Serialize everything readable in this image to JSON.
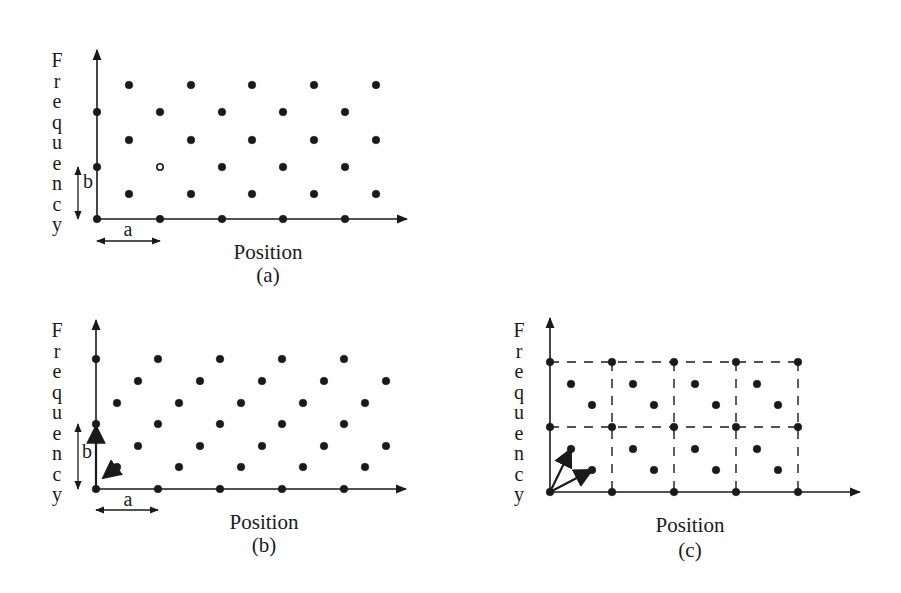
{
  "figure": {
    "ink_color": "#1a1a1a",
    "background": "#ffffff",
    "panels": [
      {
        "id": "a",
        "caption": "(a)",
        "x_label": "Position",
        "y_label": "Frequency",
        "origin": [
          97,
          219
        ],
        "x_axis_end": 407,
        "y_axis_top": 50,
        "y_label_x": 57,
        "y_label_top": 53,
        "y_label_step": 20.5,
        "x_label_pos": [
          268,
          259
        ],
        "caption_pos": [
          268,
          282
        ],
        "lattice": "rectangular-staggered",
        "points": [
          [
            97,
            219
          ],
          [
            160,
            219
          ],
          [
            222,
            219
          ],
          [
            283,
            219
          ],
          [
            345,
            219
          ],
          [
            129,
            194
          ],
          [
            191,
            194
          ],
          [
            252,
            194
          ],
          [
            314,
            194
          ],
          [
            376,
            194
          ],
          [
            97,
            167
          ],
          [
            160,
            167
          ],
          [
            222,
            167
          ],
          [
            283,
            167
          ],
          [
            345,
            167
          ],
          [
            129,
            140
          ],
          [
            191,
            140
          ],
          [
            252,
            140
          ],
          [
            314,
            140
          ],
          [
            376,
            140
          ],
          [
            97,
            112
          ],
          [
            160,
            112
          ],
          [
            222,
            112
          ],
          [
            283,
            112
          ],
          [
            345,
            112
          ],
          [
            129,
            85
          ],
          [
            191,
            85
          ],
          [
            252,
            85
          ],
          [
            314,
            85
          ],
          [
            376,
            85
          ]
        ],
        "hollow_points": [
          [
            160,
            167
          ]
        ],
        "dim_a": {
          "label": "a",
          "from": [
            97,
            241
          ],
          "to": [
            160,
            241
          ],
          "label_pos": [
            128,
            236
          ]
        },
        "dim_b": {
          "label": "b",
          "from": [
            78,
            167
          ],
          "to": [
            78,
            219
          ],
          "label_pos": [
            88,
            188
          ]
        },
        "vectors": [],
        "dashed_grid": null
      },
      {
        "id": "b",
        "caption": "(b)",
        "x_label": "Position",
        "y_label": "Frequency",
        "origin": [
          96,
          489
        ],
        "x_axis_end": 406,
        "y_axis_top": 320,
        "y_label_x": 57,
        "y_label_top": 323,
        "y_label_step": 20.5,
        "x_label_pos": [
          264,
          529
        ],
        "caption_pos": [
          264,
          552
        ],
        "lattice": "sheared",
        "points": [
          [
            96,
            489
          ],
          [
            158,
            489
          ],
          [
            220,
            489
          ],
          [
            282,
            489
          ],
          [
            344,
            489
          ],
          [
            117,
            467
          ],
          [
            179,
            467
          ],
          [
            241,
            467
          ],
          [
            303,
            467
          ],
          [
            365,
            467
          ],
          [
            138,
            446
          ],
          [
            200,
            446
          ],
          [
            262,
            446
          ],
          [
            324,
            446
          ],
          [
            386,
            446
          ],
          [
            96,
            424
          ],
          [
            158,
            424
          ],
          [
            220,
            424
          ],
          [
            282,
            424
          ],
          [
            344,
            424
          ],
          [
            117,
            403
          ],
          [
            179,
            403
          ],
          [
            241,
            403
          ],
          [
            303,
            403
          ],
          [
            365,
            403
          ],
          [
            138,
            381
          ],
          [
            200,
            381
          ],
          [
            262,
            381
          ],
          [
            324,
            381
          ],
          [
            386,
            381
          ],
          [
            96,
            359
          ],
          [
            158,
            359
          ],
          [
            220,
            359
          ],
          [
            282,
            359
          ],
          [
            344,
            359
          ]
        ],
        "hollow_points": [],
        "dim_a": {
          "label": "a",
          "from": [
            96,
            510
          ],
          "to": [
            158,
            510
          ],
          "label_pos": [
            128,
            506
          ]
        },
        "dim_b": {
          "label": "b",
          "from": [
            78,
            424
          ],
          "to": [
            78,
            489
          ],
          "label_pos": [
            87,
            458
          ]
        },
        "vectors": [
          {
            "from": [
              117,
              467
            ],
            "to": [
              103,
              478
            ],
            "head": "to"
          },
          {
            "from": [
              96,
              489
            ],
            "to": [
              96,
              426
            ],
            "head": "to"
          }
        ],
        "dashed_grid": null
      },
      {
        "id": "c",
        "caption": "(c)",
        "x_label": "Position",
        "y_label": "Frequency",
        "origin": [
          550,
          492
        ],
        "x_axis_end": 860,
        "y_axis_top": 318,
        "y_label_x": 519,
        "y_label_top": 323,
        "y_label_step": 20.5,
        "x_label_pos": [
          690,
          532
        ],
        "caption_pos": [
          690,
          557
        ],
        "lattice": "rectangular-cells-with-basis",
        "points": [
          [
            550,
            492
          ],
          [
            612,
            492
          ],
          [
            674,
            492
          ],
          [
            736,
            492
          ],
          [
            798,
            492
          ],
          [
            592,
            470
          ],
          [
            654,
            470
          ],
          [
            716,
            470
          ],
          [
            778,
            470
          ],
          [
            571,
            449
          ],
          [
            633,
            449
          ],
          [
            695,
            449
          ],
          [
            757,
            449
          ],
          [
            550,
            427
          ],
          [
            612,
            427
          ],
          [
            674,
            427
          ],
          [
            736,
            427
          ],
          [
            798,
            427
          ],
          [
            592,
            405
          ],
          [
            654,
            405
          ],
          [
            716,
            405
          ],
          [
            778,
            405
          ],
          [
            571,
            384
          ],
          [
            633,
            384
          ],
          [
            695,
            384
          ],
          [
            757,
            384
          ],
          [
            550,
            362
          ],
          [
            612,
            362
          ],
          [
            674,
            362
          ],
          [
            736,
            362
          ],
          [
            798,
            362
          ]
        ],
        "hollow_points": [],
        "dim_a": null,
        "dim_b": null,
        "vectors": [
          {
            "from": [
              550,
              492
            ],
            "to": [
              571,
              449
            ],
            "head": "to"
          },
          {
            "from": [
              550,
              492
            ],
            "to": [
              592,
              470
            ],
            "head": "to"
          }
        ],
        "dashed_grid": {
          "h_lines": [
            362,
            427
          ],
          "v_lines": [
            612,
            674,
            736,
            798
          ],
          "x_from": 550,
          "x_to": 798,
          "y_from": 362,
          "y_to": 492
        }
      }
    ]
  }
}
